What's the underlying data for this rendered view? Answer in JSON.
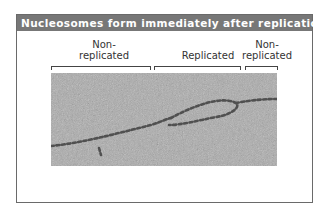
{
  "title": "Nucleosomes form immediately after replication",
  "labels": [
    {
      "id": "nonreplicated-left",
      "text_line1": "Non-",
      "text_line2": "replicated"
    },
    {
      "id": "replicated",
      "text_line1": "",
      "text_line2": "Replicated"
    },
    {
      "id": "nonreplicated-right",
      "text_line1": "Non-",
      "text_line2": "replicated"
    }
  ],
  "image": {
    "description": "electron micrograph of DNA replication bubble with nucleosomes",
    "background_color": "#a9a9a9",
    "strand_color": "#4a4a4a"
  }
}
